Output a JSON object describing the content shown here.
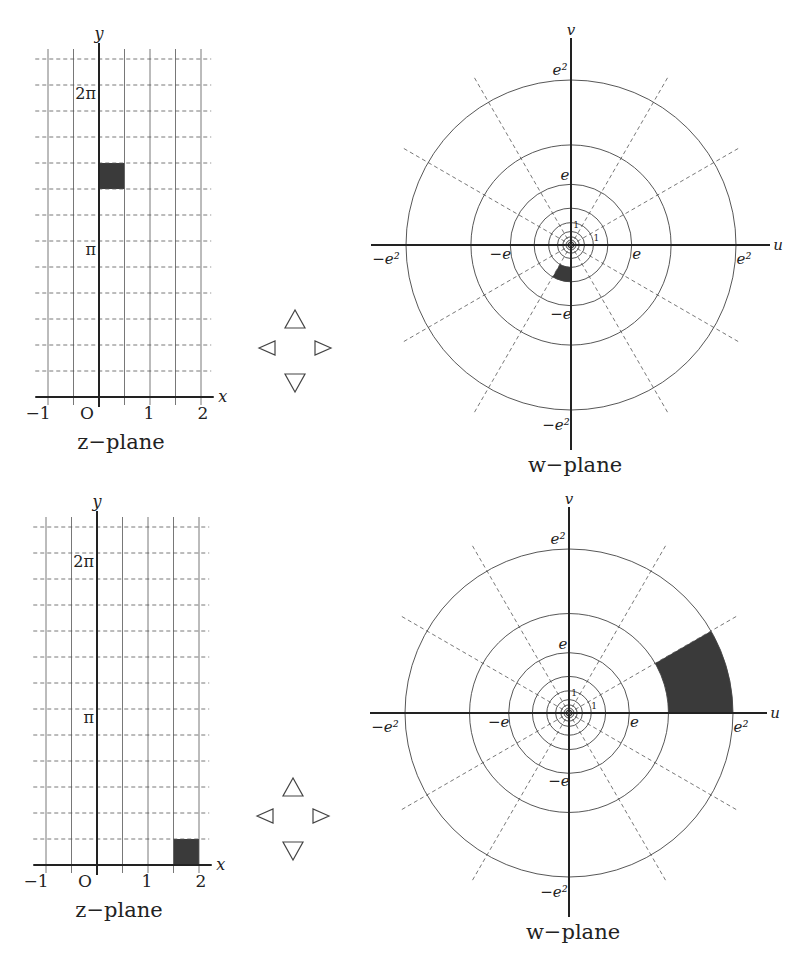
{
  "figure": {
    "panels": [
      {
        "id": "top",
        "z_plane": {
          "caption": "z−plane",
          "origin_px": [
            99,
            397
          ],
          "unit_x_px": 51,
          "step_y_px": 26,
          "x_range": [
            -1,
            2
          ],
          "x_grid": [
            -1,
            -0.5,
            0,
            0.5,
            1,
            1.5,
            2
          ],
          "y_grid_steps_pi_over_6": [
            1,
            2,
            3,
            4,
            5,
            6,
            7,
            8,
            9,
            10,
            11,
            12,
            13
          ],
          "x_axis_label": "x",
          "y_axis_label": "y",
          "x_tick_labels": [
            {
              "v": -1,
              "text": "−1"
            },
            {
              "v": 0,
              "text": "O"
            },
            {
              "v": 1,
              "text": "1"
            },
            {
              "v": 2,
              "text": "2"
            }
          ],
          "y_tick_labels": [
            {
              "k": 6,
              "text": "π"
            },
            {
              "k": 12,
              "text": "2π"
            }
          ],
          "shaded_rect": {
            "x": [
              0,
              0.5
            ],
            "y_pi_over_6": [
              8,
              9
            ]
          }
        },
        "nav_arrows": {
          "center": [
            295,
            350
          ],
          "labels": [
            "up",
            "left",
            "right",
            "down"
          ]
        },
        "w_plane": {
          "caption": "w−plane",
          "center_px": [
            571,
            245
          ],
          "radius_e2_px": 165,
          "circle_exponents": [
            2,
            1.5,
            1,
            0.5,
            0,
            -0.5,
            -1,
            -1.5,
            -2
          ],
          "ray_angles_deg": [
            30,
            60,
            120,
            150,
            210,
            240,
            300,
            330
          ],
          "u_axis_label": "u",
          "v_axis_label": "v",
          "tick_labels": {
            "e2": "e²",
            "neg_e2": "−e²",
            "e": "e",
            "neg_e": "−e",
            "one": "1"
          },
          "shaded_sector": {
            "r_exp": [
              0,
              0.5
            ],
            "theta_deg": [
              240,
              270
            ]
          }
        }
      },
      {
        "id": "bottom",
        "z_plane": {
          "caption": "z−plane",
          "origin_px": [
            97,
            865
          ],
          "unit_x_px": 51,
          "step_y_px": 26,
          "x_range": [
            -1,
            2
          ],
          "x_grid": [
            -1,
            -0.5,
            0,
            0.5,
            1,
            1.5,
            2
          ],
          "y_grid_steps_pi_over_6": [
            1,
            2,
            3,
            4,
            5,
            6,
            7,
            8,
            9,
            10,
            11,
            12,
            13
          ],
          "x_axis_label": "x",
          "y_axis_label": "y",
          "x_tick_labels": [
            {
              "v": -1,
              "text": "−1"
            },
            {
              "v": 0,
              "text": "O"
            },
            {
              "v": 1,
              "text": "1"
            },
            {
              "v": 2,
              "text": "2"
            }
          ],
          "y_tick_labels": [
            {
              "k": 6,
              "text": "π"
            },
            {
              "k": 12,
              "text": "2π"
            }
          ],
          "shaded_rect": {
            "x": [
              1.5,
              2
            ],
            "y_pi_over_6": [
              0,
              1
            ]
          }
        },
        "nav_arrows": {
          "center": [
            293,
            818
          ],
          "labels": [
            "up",
            "left",
            "right",
            "down"
          ]
        },
        "w_plane": {
          "caption": "w−plane",
          "center_px": [
            569,
            713
          ],
          "radius_e2_px": 164,
          "circle_exponents": [
            2,
            1.5,
            1,
            0.5,
            0,
            -0.5,
            -1,
            -1.5,
            -2
          ],
          "ray_angles_deg": [
            30,
            60,
            120,
            150,
            210,
            240,
            300,
            330
          ],
          "u_axis_label": "u",
          "v_axis_label": "v",
          "tick_labels": {
            "e2": "e²",
            "neg_e2": "−e²",
            "e": "e",
            "neg_e": "−e",
            "one": "1"
          },
          "shaded_sector": {
            "r_exp": [
              1.5,
              2
            ],
            "theta_deg": [
              0,
              30
            ]
          }
        }
      }
    ]
  }
}
